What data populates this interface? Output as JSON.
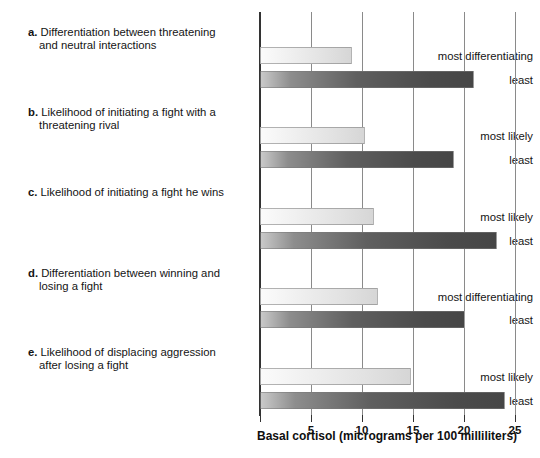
{
  "chart_data": {
    "type": "bar",
    "orientation": "horizontal",
    "title": "",
    "xlabel": "Basal cortisol (micrograms per 100 milliliters)",
    "ylabel": "",
    "xlim": [
      0,
      25
    ],
    "xticks": [
      5,
      10,
      15,
      20,
      25
    ],
    "xtick_labels": [
      "5",
      "10",
      "15",
      "20",
      "25"
    ],
    "grid": true,
    "legend": false,
    "groups": [
      {
        "letter": "a.",
        "title_line1": "Differentiation between threatening",
        "title_line2": "and neutral interactions",
        "categories": [
          "most differentiating",
          "least"
        ],
        "values": [
          9,
          21
        ]
      },
      {
        "letter": "b.",
        "title_line1": "Likelihood of initiating a fight with a",
        "title_line2": "threatening rival",
        "categories": [
          "most likely",
          "least"
        ],
        "values": [
          10.3,
          19
        ]
      },
      {
        "letter": "c.",
        "title_line1": "Likelihood of initiating a fight he wins",
        "title_line2": "",
        "categories": [
          "most likely",
          "least"
        ],
        "values": [
          11.2,
          23.2
        ]
      },
      {
        "letter": "d.",
        "title_line1": "Differentiation between winning and",
        "title_line2": "losing a fight",
        "categories": [
          "most differentiating",
          "least"
        ],
        "values": [
          11.6,
          20.1
        ]
      },
      {
        "letter": "e.",
        "title_line1": "Likelihood of displacing aggression",
        "title_line2": "after losing a fight",
        "categories": [
          "most likely",
          "least"
        ],
        "values": [
          14.8,
          24
        ]
      }
    ],
    "series": [
      {
        "name": "most",
        "values": [
          9,
          10.3,
          11.2,
          11.6,
          14.8
        ]
      },
      {
        "name": "least",
        "values": [
          21,
          19,
          23.2,
          20.1,
          24
        ]
      }
    ],
    "colors": {
      "light_bar": "#e8e8e8",
      "dark_bar": "#5a5a5a",
      "axis": "#333333",
      "gridline": "#8a8a8a",
      "text": "#141414"
    }
  }
}
